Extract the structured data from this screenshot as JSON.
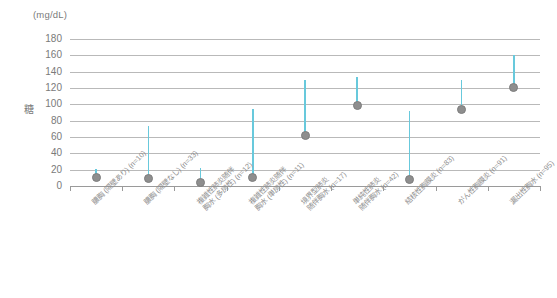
{
  "chart_data": {
    "type": "scatter",
    "title": "",
    "subtitle": "",
    "unit_label": "(mg/dL)",
    "ylabel": "糖",
    "xlabel": "",
    "ylim": [
      0,
      180
    ],
    "ytick_step": 20,
    "ytick_labels": [
      "180",
      "160",
      "140",
      "120",
      "100",
      "80",
      "60",
      "40",
      "20",
      "0"
    ],
    "ytick_values": [
      180,
      160,
      140,
      120,
      100,
      80,
      60,
      40,
      20,
      0
    ],
    "grid": true,
    "legend": "none",
    "marker_color": "#8e8e8e",
    "errorbar_color": "#68c9dc",
    "grid_color": "#b9b9b9",
    "axis_color": "#9a9a9a",
    "text_color": "#7a7a7a",
    "categories": [
      "膿胸 (隔壁あり) (n=10)",
      "膿胸 (隔壁なし) (n=33)",
      "複雑性肺炎随伴\n胸水 (多房性) (n=12)",
      "複雑性肺炎随伴\n胸水 (単房性) (n=11)",
      "境界型肺炎\n随伴胸水 (n=17)",
      "単純性肺炎\n随伴胸水 (n=42)",
      "結核性胸膜炎 (n=83)",
      "がん性胸膜炎 (n=91)",
      "漏出性胸水 (n=95)"
    ],
    "series": [
      {
        "name": "糖",
        "values": [
          11,
          9,
          4,
          10,
          62,
          99,
          8,
          94,
          121
        ],
        "upper_error": [
          21,
          73,
          22,
          94,
          130,
          133,
          92,
          130,
          161
        ]
      }
    ]
  }
}
